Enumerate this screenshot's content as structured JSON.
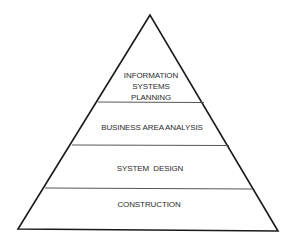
{
  "diagram": {
    "type": "pyramid",
    "colors": {
      "outline": "#1a1a1a",
      "divider": "#555555",
      "text": "#2b2b2b",
      "background": "#ffffff"
    },
    "layers": [
      {
        "name": "information-systems-planning",
        "lines": [
          "INFORMATION",
          "SYSTEMS",
          "PLANNING"
        ]
      },
      {
        "name": "business-area-analysis",
        "lines": [
          "BUSINESS AREA ANALYSIS"
        ]
      },
      {
        "name": "system-design",
        "lines": [
          "SYSTEM  DESIGN"
        ]
      },
      {
        "name": "construction",
        "lines": [
          "CONSTRUCTION"
        ]
      }
    ]
  }
}
